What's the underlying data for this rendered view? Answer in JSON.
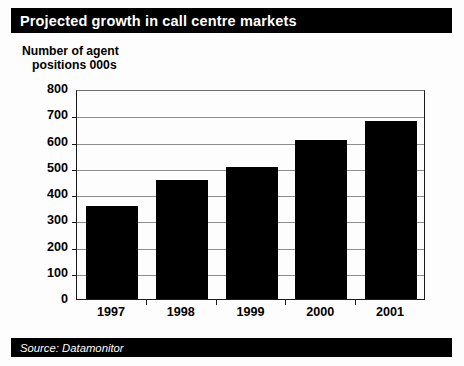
{
  "title": "Projected growth in call centre markets",
  "source_note": "Source: Datamonitor",
  "axis_caption": {
    "line1": "Number of agent",
    "line2": "positions 000s"
  },
  "colors": {
    "bar": "#000000",
    "title_bar_bg": "#000000",
    "title_text": "#ffffff",
    "gridline": "#8d8d8d",
    "axis": "#1a1a1a",
    "background": "#ffffff"
  },
  "chart_data": {
    "type": "bar",
    "title": "Projected growth in call centre markets",
    "subtitle": "",
    "xlabel": "",
    "ylabel": "Number of agent positions 000s",
    "categories": [
      "1997",
      "1998",
      "1999",
      "2000",
      "2001"
    ],
    "values": [
      355,
      452,
      502,
      605,
      680
    ],
    "ylim": [
      0,
      800
    ],
    "ytick_labels": [
      "0",
      "100",
      "200",
      "300",
      "400",
      "500",
      "600",
      "700",
      "800"
    ],
    "ytick_values": [
      0,
      100,
      200,
      300,
      400,
      500,
      600,
      700,
      800
    ],
    "grid": true,
    "grid_axis": "y",
    "legend": false,
    "legend_position": "none",
    "series": [
      {
        "name": "Agent positions 000s",
        "values": [
          355,
          452,
          502,
          605,
          680
        ],
        "color": "#000000"
      }
    ],
    "annotations": [
      "Source: Datamonitor"
    ]
  }
}
